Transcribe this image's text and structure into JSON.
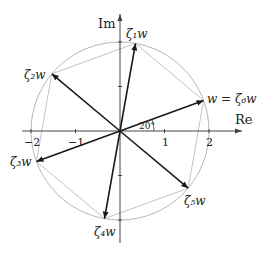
{
  "diagram": {
    "axes": {
      "x_label": "Re",
      "y_label": "Im",
      "x_ticks": [
        "−2",
        "−1",
        "1",
        "2"
      ]
    },
    "angle_label": "20°",
    "radius": 2,
    "base_angle_deg": 20,
    "vectors": [
      {
        "name": "zeta1w",
        "label": "ζ₁w",
        "angle_deg": 80
      },
      {
        "name": "zeta2w",
        "label": "ζ₂w",
        "angle_deg": 140
      },
      {
        "name": "zeta3w",
        "label": "ζ₃w",
        "angle_deg": 200
      },
      {
        "name": "zeta4w",
        "label": "ζ₄w",
        "angle_deg": 260
      },
      {
        "name": "zeta5w",
        "label": "ζ₅w",
        "angle_deg": 320
      },
      {
        "name": "zeta6w",
        "label": "w = ζ₆w",
        "angle_deg": 20
      }
    ],
    "colors": {
      "vector": "#1a1a1a",
      "axis": "#444444",
      "circle": "#b8b8b8",
      "polygon": "#c4c4c4"
    }
  }
}
